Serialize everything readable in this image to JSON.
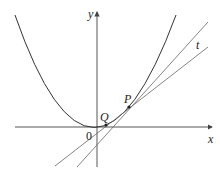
{
  "diagram": {
    "labels": {
      "y_axis": "y",
      "x_axis": "x",
      "origin": "0",
      "point_p": "P",
      "point_q": "Q",
      "tangent": "t"
    },
    "colors": {
      "curve": "#333333",
      "lines": "#666666",
      "axes": "#444444",
      "background": "#ffffff"
    }
  }
}
